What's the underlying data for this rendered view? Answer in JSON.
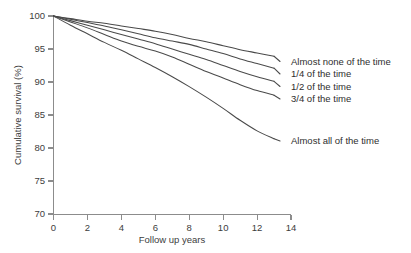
{
  "chart_data": {
    "type": "line",
    "title": "",
    "xlabel": "Follow up years",
    "ylabel": "Cumulative survival (%)",
    "xlim": [
      0,
      14
    ],
    "ylim": [
      70,
      100
    ],
    "xticks": [
      0,
      2,
      4,
      6,
      8,
      10,
      12,
      14
    ],
    "yticks": [
      70,
      75,
      80,
      85,
      90,
      95,
      100
    ],
    "xtick_labels": [
      "0",
      "2",
      "4",
      "6",
      "8",
      "10",
      "12",
      "14"
    ],
    "ytick_labels": [
      "70",
      "75",
      "80",
      "85",
      "90",
      "95",
      "100"
    ],
    "grid": false,
    "legend_position": "inline-right",
    "line_color": "#4a4a4a",
    "axis_color": "#8c8c8c",
    "background_color": "#ffffff",
    "x": [
      0,
      1,
      2,
      3,
      4,
      5,
      6,
      7,
      8,
      9,
      10,
      11,
      12,
      13
    ],
    "series": [
      {
        "name": "Almost none of the time",
        "label": "Almost none of the time",
        "values": [
          100.0,
          99.6,
          99.2,
          98.9,
          98.5,
          98.1,
          97.7,
          97.2,
          96.6,
          96.1,
          95.5,
          94.9,
          94.4,
          93.9
        ]
      },
      {
        "name": "1/4 of the time",
        "label": "1/4 of the time",
        "values": [
          100.0,
          99.5,
          99.0,
          98.5,
          97.9,
          97.3,
          96.7,
          96.2,
          95.7,
          95.0,
          94.3,
          93.5,
          92.8,
          92.1
        ]
      },
      {
        "name": "1/2 of the time",
        "label": "1/2 of the time",
        "values": [
          100.0,
          99.3,
          98.6,
          97.9,
          97.2,
          96.5,
          95.8,
          95.0,
          94.2,
          93.4,
          92.5,
          91.6,
          90.8,
          90.1
        ]
      },
      {
        "name": "3/4 of the time",
        "label": "3/4 of the time",
        "values": [
          100.0,
          99.1,
          98.2,
          97.2,
          96.2,
          95.4,
          94.7,
          93.8,
          92.7,
          91.6,
          90.6,
          89.6,
          88.7,
          88.0
        ]
      },
      {
        "name": "Almost all of the time",
        "label": "Almost all of the time",
        "values": [
          100.0,
          98.6,
          97.3,
          96.0,
          94.8,
          93.5,
          92.2,
          90.8,
          89.3,
          87.7,
          86.0,
          84.2,
          82.6,
          81.4
        ]
      }
    ]
  }
}
